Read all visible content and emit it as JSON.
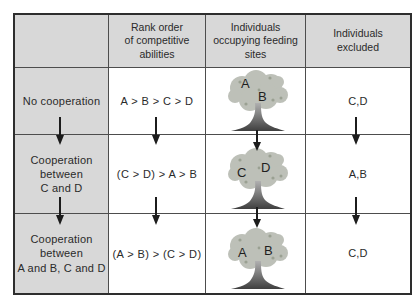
{
  "figure": {
    "title_semantic": "cooperation-feeding-sites-diagram",
    "headers": {
      "scenario": "",
      "rank": "Rank order\nof competitive\nabilities",
      "feeding": "Individuals\noccupying feeding\nsites",
      "excluded": "Individuals\nexcluded"
    },
    "rows": [
      {
        "scenario": "No cooperation",
        "rank": "A > B > C > D",
        "occupants": [
          "A",
          "B"
        ],
        "excluded": "C,D"
      },
      {
        "scenario": "Cooperation\nbetween\nC and D",
        "rank": "(C > D) > A > B",
        "occupants": [
          "C",
          "D"
        ],
        "excluded": "A,B"
      },
      {
        "scenario": "Cooperation\nbetween\nA and B, C and D",
        "rank": "(A > B) > (C > D)",
        "occupants": [
          "A",
          "B"
        ],
        "excluded": "C,D"
      }
    ],
    "colors": {
      "cell_gray": "#d8d8d8",
      "border": "#4d4d4d",
      "arrow": "#1c1c1c",
      "canopy": "#bdc0b8",
      "canopy_speckle": "#9aa092",
      "trunk_dark": "#3f3f3f"
    }
  }
}
